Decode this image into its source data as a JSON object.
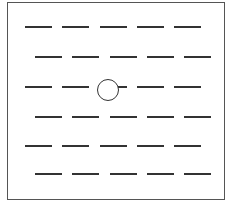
{
  "figure": {
    "rows": [
      {
        "y": 26,
        "offset": 0,
        "dashes": 5
      },
      {
        "y": 56,
        "offset": 10,
        "dashes": 5
      },
      {
        "y": 86,
        "offset": 0,
        "dashes": 5,
        "circle_at_dash": 2
      },
      {
        "y": 116,
        "offset": 10,
        "dashes": 5
      },
      {
        "y": 145,
        "offset": 0,
        "dashes": 5
      },
      {
        "y": 173,
        "offset": 10,
        "dashes": 5
      }
    ],
    "dash_start_x": 25,
    "dash_length": 27,
    "dash_pitch": 37.3,
    "circle": {
      "cx": 108,
      "cy": 90,
      "r": 11
    },
    "colors": {
      "line": "#333333",
      "border": "#555555",
      "background": "#ffffff"
    }
  }
}
